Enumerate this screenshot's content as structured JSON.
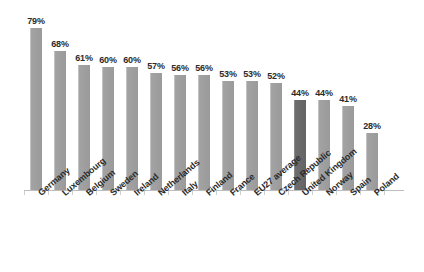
{
  "chart_data": {
    "type": "bar",
    "title": "",
    "subtitle": "",
    "xlabel": "",
    "ylabel": "",
    "ylim": [
      0,
      100
    ],
    "grid": false,
    "legend": "none",
    "value_suffix": "%",
    "categories": [
      "Germany",
      "Luxembourg",
      "Belgium",
      "Sweden",
      "Ireland",
      "Netherlands",
      "Italy",
      "Finland",
      "France",
      "EU27 average",
      "Czech Republic",
      "United Kingdom",
      "Norway",
      "Spain",
      "Poland"
    ],
    "values": [
      79,
      68,
      61,
      60,
      60,
      57,
      56,
      56,
      53,
      53,
      52,
      44,
      44,
      41,
      28
    ],
    "data_labels": [
      "79%",
      "68%",
      "61%",
      "60%",
      "60%",
      "57%",
      "56%",
      "56%",
      "53%",
      "53%",
      "52%",
      "44%",
      "44%",
      "41%",
      "28%"
    ],
    "highlighted_index": 11,
    "highlighted_category": "United Kingdom",
    "colors": {
      "bar": "#a3a3a3",
      "bar_highlight": "#6e6e6e",
      "axis": "#bdbdbd",
      "label_text": "#2b2b2b",
      "background": "#ffffff"
    }
  }
}
